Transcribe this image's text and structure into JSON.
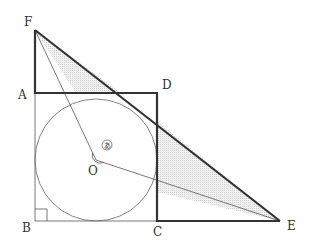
{
  "figure": {
    "type": "geometry",
    "points": {
      "F": {
        "label": "F",
        "x": 35,
        "y": 30
      },
      "A": {
        "label": "A",
        "x": 35,
        "y": 93
      },
      "D": {
        "label": "D",
        "x": 157,
        "y": 93
      },
      "B": {
        "label": "B",
        "x": 35,
        "y": 221
      },
      "C": {
        "label": "C",
        "x": 157,
        "y": 221
      },
      "E": {
        "label": "E",
        "x": 280,
        "y": 221
      },
      "O": {
        "label": "O",
        "x": 96,
        "y": 160
      }
    },
    "circle": {
      "center": "O",
      "radius": 61
    },
    "angle_mark": {
      "label": "あ",
      "at": "O",
      "between": [
        "OF",
        "OE"
      ]
    },
    "right_angle_at": "B",
    "colors": {
      "stroke": "#333333",
      "shade": "#e6e6e6"
    }
  }
}
